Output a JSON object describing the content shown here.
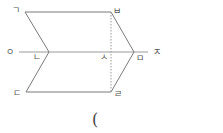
{
  "diagram": {
    "type": "geometry-figure",
    "colors": {
      "stroke": "#7a7a7a",
      "dashed": "#9a9a9a",
      "label": "#555555",
      "background": "#ffffff"
    },
    "labels": {
      "g": "ㄱ",
      "b": "ㅂ",
      "o": "ㅇ",
      "n": "ㄴ",
      "s": "ㅅ",
      "m": "ㅁ",
      "j": "ㅈ",
      "d": "ㄷ",
      "r": "ㄹ"
    },
    "points": {
      "g": [
        25,
        12
      ],
      "b": [
        111,
        12
      ],
      "n": [
        49,
        52
      ],
      "m": [
        134,
        52
      ],
      "d": [
        26,
        92
      ],
      "r": [
        111,
        92
      ],
      "s": [
        111,
        52
      ],
      "o": [
        19,
        52
      ],
      "j": [
        146,
        52
      ]
    },
    "segments": [
      [
        "g",
        "b"
      ],
      [
        "b",
        "m"
      ],
      [
        "m",
        "r"
      ],
      [
        "r",
        "d"
      ],
      [
        "d",
        "n"
      ],
      [
        "n",
        "g"
      ],
      [
        "o",
        "j"
      ]
    ],
    "dashed_segments": [
      [
        "b",
        "r"
      ]
    ]
  },
  "answer_blank": {
    "open_paren": "("
  }
}
